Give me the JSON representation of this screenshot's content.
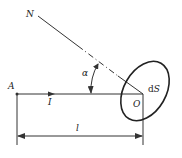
{
  "figure": {
    "labels": {
      "normal": "N",
      "point_a": "A",
      "current": "I",
      "angle": "α",
      "origin": "O",
      "area_element_d": "d",
      "area_element_s": "S",
      "length": "l"
    },
    "colors": {
      "stroke": "#333333",
      "text": "#222222",
      "background": "#ffffff"
    }
  }
}
